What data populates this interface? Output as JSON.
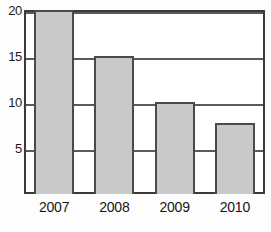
{
  "chart_data": {
    "type": "bar",
    "title": "",
    "subtitle": "",
    "xlabel": "",
    "ylabel": "",
    "categories": [
      "2007",
      "2008",
      "2009",
      "2010"
    ],
    "values": [
      20,
      15,
      10,
      7.7
    ],
    "ylim": [
      0,
      20
    ],
    "xlim": [
      0,
      4
    ],
    "yticks": [
      5,
      10,
      15,
      20
    ],
    "ytick_labels": [
      "5",
      "10",
      "15",
      "20"
    ],
    "xtick_labels": [
      "2007",
      "2008",
      "2009",
      "2010"
    ],
    "grid": true,
    "grid_axis": "y",
    "legend": false,
    "legend_position": "none",
    "annotations": [],
    "colors": {
      "bar_fill": "#c9c9c9",
      "bar_edge": "#4a4a4a",
      "axis": "#3a3a3a",
      "gridline": "#5a5a5a",
      "text": "#161616",
      "background": "#fdfdfd",
      "plot_background": "#ffffff"
    }
  },
  "axes": {
    "y": {
      "ticks": [
        {
          "label": "20",
          "value": 20
        },
        {
          "label": "15",
          "value": 15
        },
        {
          "label": "10",
          "value": 10
        },
        {
          "label": "5",
          "value": 5
        }
      ]
    },
    "x": {
      "ticks": [
        {
          "label": "2007"
        },
        {
          "label": "2008"
        },
        {
          "label": "2009"
        },
        {
          "label": "2010"
        }
      ]
    }
  },
  "bars": [
    {
      "category": "2007",
      "value": 20
    },
    {
      "category": "2008",
      "value": 15
    },
    {
      "category": "2009",
      "value": 10
    },
    {
      "category": "2010",
      "value": 7.7
    }
  ]
}
